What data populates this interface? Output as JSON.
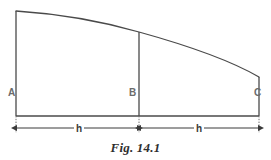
{
  "figure": {
    "caption": "Fig. 14.1",
    "type": "engineering-line-diagram",
    "background_color": "#ffffff",
    "stroke_color": "#4a4a4a",
    "dimension_color": "#3a3a3a",
    "label_color": "#6b6b6b"
  },
  "vertices": [
    {
      "id": "A",
      "label": "A",
      "x": 16,
      "y": 116,
      "label_x": 8,
      "label_y": 88
    },
    {
      "id": "B",
      "label": "B",
      "x": 139,
      "y": 116,
      "label_x": 129,
      "label_y": 88
    },
    {
      "id": "C",
      "label": "C",
      "x": 259,
      "y": 116,
      "label_x": 254,
      "label_y": 88
    }
  ],
  "dimensions": [
    {
      "label": "h",
      "from": "A",
      "to": "B",
      "label_x": 74,
      "label_y": 124
    },
    {
      "label": "h",
      "from": "B",
      "to": "C",
      "label_x": 194,
      "label_y": 124
    }
  ],
  "geometry": {
    "baseline_y": 116,
    "top_left_y": 11,
    "top_mid_y": 32,
    "top_right_y": 77,
    "dimension_line_y": 128,
    "curve_description": "concave-downward curve from top of A to top of C passing through top of B"
  }
}
